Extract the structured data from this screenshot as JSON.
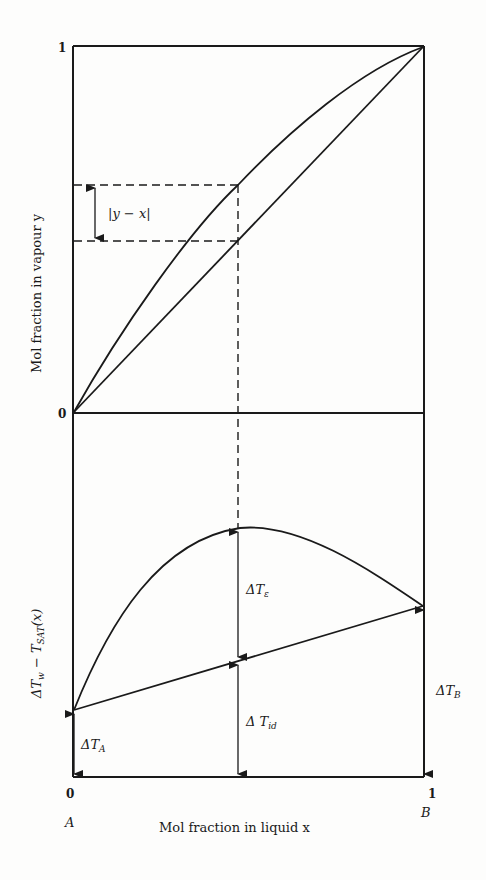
{
  "diagram": {
    "top_panel": {
      "y_axis_label": "Mol fraction in vapour y",
      "y_tick_top": "1",
      "y_tick_bottom": "0",
      "difference_label": "|y − x|",
      "curves": [
        "equilibrium curve y(x)",
        "diagonal y = x"
      ]
    },
    "bottom_panel": {
      "y_axis_label_main": "ΔT",
      "y_axis_label_sub1": "w",
      "y_axis_label_mid": " − T",
      "y_axis_label_sub2": "SAT",
      "y_axis_label_end": "(x)",
      "x_axis_label": "Mol fraction in liquid x",
      "x_tick_left": "0",
      "x_tick_right": "1",
      "component_left": "A",
      "component_right": "B",
      "delta_e_main": "ΔT",
      "delta_e_sub": "ε",
      "delta_id_main": "Δ T",
      "delta_id_sub": "id",
      "delta_a_main": "ΔT",
      "delta_a_sub": "A",
      "delta_b_main": "ΔT",
      "delta_b_sub": "B"
    }
  },
  "colors": {
    "line": "#1a1a1a",
    "background": "#fdfdfc"
  }
}
